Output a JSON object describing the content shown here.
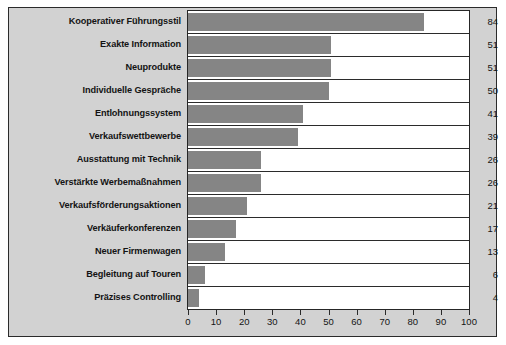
{
  "chart_data": {
    "type": "bar",
    "orientation": "horizontal",
    "title": "",
    "subtitle": "",
    "xlabel": "",
    "ylabel": "",
    "xlim": [
      0,
      100
    ],
    "grid": false,
    "legend": null,
    "xticks": [
      "0",
      "10",
      "20",
      "30",
      "40",
      "50",
      "60",
      "70",
      "80",
      "90",
      "100"
    ],
    "xtick_values": [
      0,
      10,
      20,
      30,
      40,
      50,
      60,
      70,
      80,
      90,
      100
    ],
    "categories": [
      "Kooperativer Führungsstil",
      "Exakte Information",
      "Neuprodukte",
      "Individuelle Gespräche",
      "Entlohnungssystem",
      "Verkaufswettbewerbe",
      "Ausstattung mit Technik",
      "Verstärkte Werbemaßnahmen",
      "Verkaufsförderungsaktionen",
      "Verkäuferkonferenzen",
      "Neuer Firmenwagen",
      "Begleitung auf Touren",
      "Präzises Controlling"
    ],
    "values": [
      84,
      51,
      51,
      50,
      41,
      39,
      26,
      26,
      21,
      17,
      13,
      6,
      4
    ],
    "value_labels": [
      "84",
      "51",
      "51",
      "50",
      "41",
      "39",
      "26",
      "26",
      "21",
      "17",
      "13",
      "6",
      "4"
    ],
    "colors": {
      "bar": "#858585",
      "panel_background": "#d2d2d2",
      "plot_background": "#ffffff",
      "frame": "#2b2b2b",
      "text": "#141414"
    }
  }
}
